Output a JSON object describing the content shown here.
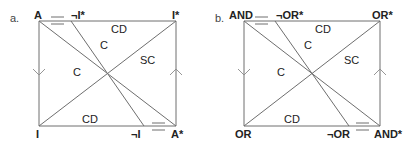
{
  "panels": [
    {
      "letter": "a.",
      "corners": {
        "top_left": "A",
        "top_mid": "¬I*",
        "top_right": "I*",
        "bottom_left": "I",
        "bottom_mid": "¬I",
        "bottom_right": "A*"
      },
      "edges": {
        "top": "CD",
        "bottom": "CD",
        "diag_inner": "C",
        "diag_outer": "C",
        "diag_rising": "SC"
      },
      "arrows": {
        "left": "down",
        "right": "up"
      },
      "equality_marks": [
        "between A and ¬I*",
        "between ¬I and A*"
      ]
    },
    {
      "letter": "b.",
      "corners": {
        "top_left": "AND",
        "top_mid": "¬OR*",
        "top_right": "OR*",
        "bottom_left": "OR",
        "bottom_mid": "¬OR",
        "bottom_right": "AND*"
      },
      "edges": {
        "top": "CD",
        "bottom": "CD",
        "diag_inner": "C",
        "diag_outer": "C",
        "diag_rising": "SC"
      },
      "arrows": {
        "left": "down",
        "right": "up"
      },
      "equality_marks": [
        "between AND and ¬OR*",
        "between ¬OR and AND*"
      ]
    }
  ]
}
